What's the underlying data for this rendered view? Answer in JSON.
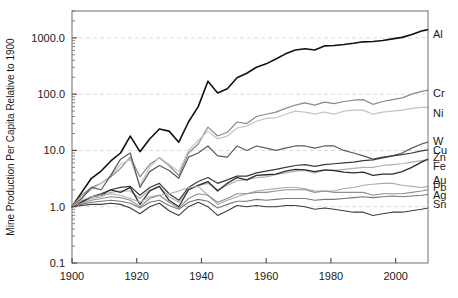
{
  "chart_data": {
    "type": "line",
    "title": "",
    "xlabel": "",
    "ylabel": "Mine Production Per Capita Relative to 1900",
    "xlim": [
      1900,
      2010
    ],
    "ylim": [
      0.1,
      3000
    ],
    "yscale": "log",
    "xticks": [
      1900,
      1920,
      1940,
      1960,
      1980,
      2000
    ],
    "xtick_labels": [
      "1900",
      "1920",
      "1940",
      "1960",
      "1980",
      "2000"
    ],
    "yticks": [
      0.1,
      1.0,
      10.0,
      100.0,
      1000.0
    ],
    "ytick_labels": [
      "0.1",
      "1.0",
      "10.0",
      "100.0",
      "1000.0"
    ],
    "grid": "horizontal-dashed-light",
    "legend_position": "right-of-axes-inline",
    "x": [
      1900,
      1903,
      1906,
      1909,
      1912,
      1915,
      1918,
      1921,
      1924,
      1927,
      1930,
      1933,
      1936,
      1939,
      1942,
      1945,
      1948,
      1951,
      1954,
      1957,
      1960,
      1963,
      1966,
      1969,
      1972,
      1975,
      1978,
      1981,
      1984,
      1987,
      1990,
      1993,
      1996,
      1999,
      2002,
      2005,
      2008,
      2010
    ],
    "series": [
      {
        "name": "Al",
        "label": "Al",
        "color": "#111111",
        "width": 1.6,
        "label_y_value": 1150,
        "values": [
          1.0,
          1.8,
          3.2,
          4.3,
          6.5,
          9.0,
          18.0,
          9.5,
          16.0,
          24.0,
          22.0,
          14.0,
          32.0,
          60.0,
          170.0,
          105.0,
          125.0,
          195.0,
          235.0,
          300.0,
          345.0,
          420.0,
          520.0,
          610.0,
          640.0,
          610.0,
          720.0,
          730.0,
          760.0,
          800.0,
          850.0,
          860.0,
          900.0,
          960.0,
          1020.0,
          1150.0,
          1320.0,
          1400.0
        ]
      },
      {
        "name": "Cr",
        "label": "Cr",
        "color": "#8a8a8a",
        "width": 1.2,
        "label_y_value": 105,
        "values": [
          1.0,
          1.6,
          2.2,
          2.6,
          3.4,
          4.8,
          7.6,
          3.4,
          5.6,
          7.4,
          5.4,
          3.6,
          9.0,
          13.0,
          26.0,
          18.0,
          21.0,
          32.0,
          30.0,
          40.0,
          44.0,
          48.0,
          56.0,
          64.0,
          70.0,
          64.0,
          72.0,
          68.0,
          74.0,
          78.0,
          80.0,
          66.0,
          74.0,
          80.0,
          86.0,
          100.0,
          112.0,
          118.0
        ]
      },
      {
        "name": "Ni",
        "label": "Ni",
        "color": "#c4c4c4",
        "width": 1.2,
        "label_y_value": 46,
        "values": [
          1.0,
          1.5,
          2.0,
          2.6,
          3.6,
          5.6,
          7.0,
          2.4,
          5.0,
          7.6,
          5.6,
          4.2,
          10.0,
          15.0,
          22.0,
          16.0,
          18.0,
          25.0,
          27.0,
          33.0,
          37.0,
          38.0,
          44.0,
          50.0,
          48.0,
          44.0,
          48.0,
          44.0,
          50.0,
          52.0,
          52.0,
          44.0,
          48.0,
          50.0,
          52.0,
          56.0,
          58.0,
          58.0
        ]
      },
      {
        "name": "W",
        "label": "W",
        "color": "#5a5a5a",
        "width": 1.2,
        "label_y_value": 14.5,
        "values": [
          1.0,
          1.4,
          2.2,
          2.0,
          3.6,
          7.0,
          9.0,
          2.2,
          4.2,
          5.4,
          4.4,
          3.2,
          7.6,
          9.0,
          12.0,
          8.0,
          7.6,
          12.0,
          10.0,
          12.0,
          11.0,
          10.0,
          11.0,
          12.0,
          12.0,
          11.0,
          12.0,
          12.0,
          10.0,
          9.0,
          8.0,
          7.0,
          7.6,
          8.0,
          9.0,
          11.0,
          13.0,
          14.0
        ]
      },
      {
        "name": "Cu",
        "label": "Cu",
        "color": "#3a3a3a",
        "width": 1.2,
        "label_y_value": 10.0,
        "values": [
          1.0,
          1.25,
          1.5,
          1.7,
          2.0,
          2.2,
          2.3,
          1.6,
          2.2,
          2.6,
          1.7,
          1.3,
          2.2,
          2.8,
          3.3,
          2.6,
          3.0,
          3.5,
          3.5,
          4.0,
          4.3,
          4.6,
          5.0,
          5.4,
          5.6,
          5.2,
          5.6,
          5.8,
          6.0,
          6.2,
          6.6,
          6.8,
          7.4,
          8.0,
          8.4,
          9.0,
          9.8,
          10.2
        ]
      },
      {
        "name": "Zn",
        "label": "Zn",
        "color": "#b0b0b0",
        "width": 1.2,
        "label_y_value": 7.6,
        "values": [
          1.0,
          1.2,
          1.4,
          1.5,
          1.8,
          1.9,
          1.9,
          1.4,
          2.0,
          2.3,
          1.5,
          1.2,
          2.0,
          2.4,
          2.6,
          2.0,
          2.4,
          2.9,
          3.0,
          3.3,
          3.4,
          3.7,
          4.0,
          4.3,
          4.4,
          4.0,
          4.4,
          4.4,
          4.6,
          4.8,
          5.0,
          5.0,
          5.4,
          5.6,
          5.8,
          6.2,
          6.6,
          6.8
        ]
      },
      {
        "name": "Fe",
        "label": "Fe",
        "color": "#2e2e2e",
        "width": 1.3,
        "label_y_value": 5.2,
        "values": [
          1.0,
          1.2,
          1.5,
          1.6,
          2.0,
          1.8,
          2.2,
          1.1,
          1.9,
          2.3,
          1.3,
          1.0,
          2.0,
          2.4,
          2.8,
          1.9,
          2.6,
          3.3,
          3.0,
          3.6,
          3.7,
          3.8,
          4.3,
          4.6,
          4.5,
          4.2,
          4.5,
          4.4,
          4.1,
          4.0,
          4.1,
          3.6,
          3.8,
          3.8,
          4.2,
          5.0,
          6.2,
          7.0
        ]
      },
      {
        "name": "Au",
        "label": "Au",
        "color": "#adadad",
        "width": 1.1,
        "label_y_value": 3.0,
        "values": [
          1.0,
          1.3,
          1.5,
          1.6,
          1.7,
          1.6,
          1.4,
          1.2,
          1.5,
          1.6,
          1.7,
          1.9,
          2.2,
          2.3,
          1.6,
          1.1,
          1.3,
          1.5,
          1.7,
          1.9,
          2.0,
          2.1,
          2.2,
          2.2,
          2.1,
          1.9,
          1.9,
          1.9,
          2.1,
          2.2,
          2.4,
          2.5,
          2.6,
          2.6,
          2.4,
          2.3,
          2.2,
          2.3
        ]
      },
      {
        "name": "Pb",
        "label": "Pb",
        "color": "#909090",
        "width": 1.1,
        "label_y_value": 2.2,
        "values": [
          1.0,
          1.15,
          1.3,
          1.4,
          1.5,
          1.45,
          1.3,
          1.0,
          1.4,
          1.6,
          1.2,
          0.95,
          1.4,
          1.7,
          1.6,
          1.2,
          1.4,
          1.7,
          1.7,
          1.8,
          1.8,
          1.9,
          2.0,
          2.0,
          2.0,
          1.8,
          1.9,
          1.8,
          1.8,
          1.8,
          1.8,
          1.6,
          1.7,
          1.7,
          1.7,
          1.8,
          1.9,
          2.0
        ]
      },
      {
        "name": "Ag",
        "label": "Ag",
        "color": "#787878",
        "width": 1.1,
        "label_y_value": 1.6,
        "values": [
          1.0,
          1.1,
          1.2,
          1.25,
          1.3,
          1.25,
          1.15,
          0.95,
          1.2,
          1.3,
          1.05,
          0.9,
          1.2,
          1.35,
          1.25,
          0.95,
          1.1,
          1.25,
          1.25,
          1.35,
          1.3,
          1.35,
          1.4,
          1.4,
          1.4,
          1.3,
          1.35,
          1.35,
          1.4,
          1.45,
          1.5,
          1.45,
          1.5,
          1.55,
          1.5,
          1.55,
          1.6,
          1.65
        ]
      },
      {
        "name": "Sn",
        "label": "Sn",
        "color": "#3d3d3d",
        "width": 1.1,
        "label_y_value": 1.1,
        "values": [
          1.0,
          1.05,
          1.1,
          1.1,
          1.15,
          1.1,
          0.95,
          0.75,
          1.0,
          1.15,
          0.85,
          0.7,
          1.0,
          1.2,
          1.0,
          0.7,
          0.85,
          1.05,
          1.0,
          1.05,
          1.0,
          1.0,
          1.05,
          1.05,
          1.0,
          0.9,
          0.95,
          0.9,
          0.85,
          0.8,
          0.8,
          0.7,
          0.75,
          0.8,
          0.8,
          0.85,
          0.9,
          0.95
        ]
      }
    ]
  },
  "axes": {
    "ylabel": "Mine Production Per Capita Relative to 1900"
  }
}
